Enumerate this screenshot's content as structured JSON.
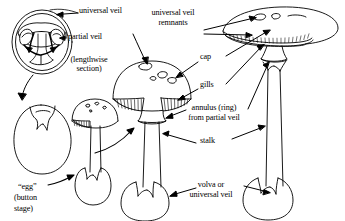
{
  "figure": {
    "type": "labeled-line-drawing",
    "background_color": "#ffffff",
    "ink_color": "#000000",
    "width": 345,
    "height": 221
  },
  "labels": {
    "universal_veil": "universal veil",
    "partial_veil": "partial veil",
    "lengthwise_section_line1": "(lengthwise",
    "lengthwise_section_line2": "section)",
    "egg_line1": "“egg”",
    "egg_line2": "(button",
    "egg_line3": "stage)",
    "uv_remnants_line1": "universal veil",
    "uv_remnants_line2": "remnants",
    "cap": "cap",
    "gills": "gills",
    "annulus_line1": "annulus (ring)",
    "annulus_line2": "from partial veil",
    "stalk": "stalk",
    "volva_line1": "volva or",
    "volva_line2": "universal veil"
  },
  "specimens": [
    {
      "name": "egg-cross-section",
      "caption": "(lengthwise section)",
      "parts": [
        "universal veil",
        "partial veil"
      ]
    },
    {
      "name": "egg-button-stage",
      "caption": "“egg” (button stage)",
      "parts": [
        "universal veil"
      ]
    },
    {
      "name": "young-mushroom",
      "caption": "",
      "parts": [
        "cap",
        "gills",
        "stalk",
        "volva"
      ]
    },
    {
      "name": "expanding-mushroom",
      "caption": "",
      "parts": [
        "universal veil remnants",
        "cap",
        "gills",
        "annulus",
        "stalk",
        "volva"
      ]
    },
    {
      "name": "mature-mushroom",
      "caption": "",
      "parts": [
        "universal veil remnants",
        "cap",
        "gills",
        "annulus",
        "stalk",
        "volva"
      ]
    }
  ]
}
